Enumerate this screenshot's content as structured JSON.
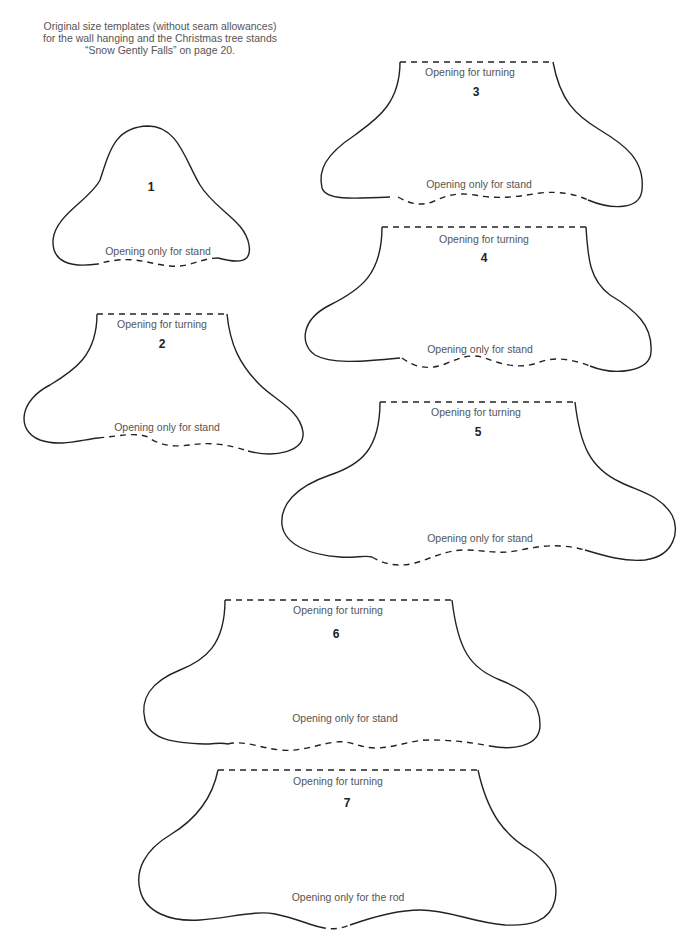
{
  "header": {
    "line1": "Original size templates (without seam allowances)",
    "line2": "for the wall hanging and the Christmas tree stands",
    "line3": "“Snow Gently Falls” on page 20."
  },
  "templates": [
    {
      "number": "1",
      "bottom_label": "Opening only for stand"
    },
    {
      "number": "2",
      "top_label": "Opening for turning",
      "bottom_label": "Opening only for stand"
    },
    {
      "number": "3",
      "top_label": "Opening for turning",
      "bottom_label": "Opening only for stand"
    },
    {
      "number": "4",
      "top_label": "Opening for turning",
      "bottom_label": "Opening only for stand"
    },
    {
      "number": "5",
      "top_label": "Opening for turning",
      "bottom_label": "Opening only for stand"
    },
    {
      "number": "6",
      "top_label": "Opening for turning",
      "bottom_label": "Opening only for stand"
    },
    {
      "number": "7",
      "top_label": "Opening for turning",
      "bottom_label": "Opening only for the rod"
    }
  ]
}
